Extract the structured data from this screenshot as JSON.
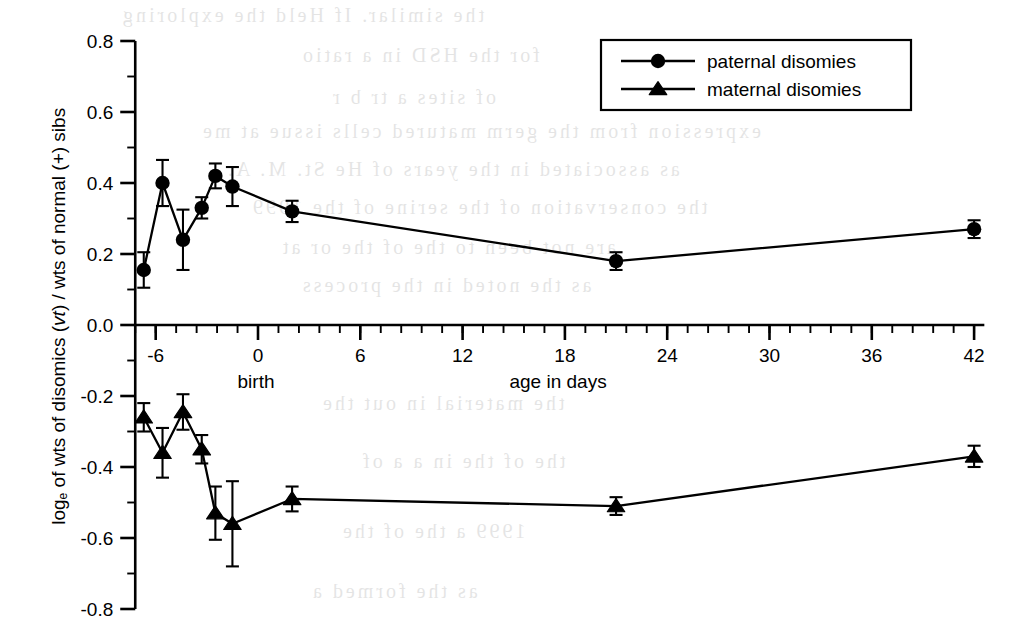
{
  "figure": {
    "background_color": "#ffffff",
    "ink_color": "#000000"
  },
  "y_axis": {
    "caption_prefix": "log",
    "caption_subscript": "e",
    "caption_mid": " of wts of disomics (",
    "caption_italic": "vt",
    "caption_suffix": ") / wts of normal (+) sibs",
    "tick_labels": [
      "0.8",
      "0.6",
      "0.4",
      "0.2",
      "0.0",
      "-0.2",
      "-0.4",
      "-0.6",
      "-0.8"
    ],
    "tick_values": [
      0.8,
      0.6,
      0.4,
      0.2,
      0.0,
      -0.2,
      -0.4,
      -0.6,
      -0.8
    ],
    "limits": [
      -0.8,
      0.8
    ],
    "minor_ticks_between": 1
  },
  "x_axis": {
    "title": "age in days",
    "birth_label": "birth",
    "tick_labels": [
      "-6",
      "0",
      "6",
      "12",
      "18",
      "24",
      "30",
      "36",
      "42"
    ],
    "tick_values": [
      -6,
      0,
      6,
      12,
      18,
      24,
      30,
      36,
      42
    ],
    "limits": [
      -7.2,
      42.6
    ],
    "minor_tick_step": 1.2
  },
  "legend": {
    "position": "top-right",
    "entries": [
      {
        "label": "paternal disomies",
        "marker": "circle"
      },
      {
        "label": "maternal disomies",
        "marker": "triangle"
      }
    ]
  },
  "chart_data": {
    "type": "line",
    "title": "",
    "xlabel": "age in days",
    "ylabel": "log_e of wts of disomics (vt) / wts of normal (+) sibs",
    "xlim": [
      -7.2,
      42.6
    ],
    "ylim": [
      -0.8,
      0.8
    ],
    "grid": false,
    "legend_position": "top-right",
    "error_bars": "symmetric (standard error)",
    "annotations": [
      {
        "text": "birth",
        "x": 0,
        "note": "label beneath x = 0 tick"
      }
    ],
    "series": [
      {
        "name": "paternal disomies",
        "marker": "circle",
        "x": [
          -6.7,
          -5.6,
          -4.4,
          -3.3,
          -2.5,
          -1.5,
          2.0,
          21.0,
          42.0
        ],
        "y": [
          0.155,
          0.4,
          0.24,
          0.33,
          0.42,
          0.39,
          0.32,
          0.18,
          0.27
        ],
        "yerr": [
          0.05,
          0.065,
          0.085,
          0.03,
          0.035,
          0.055,
          0.03,
          0.025,
          0.025
        ]
      },
      {
        "name": "maternal disomies",
        "marker": "triangle",
        "x": [
          -6.7,
          -5.6,
          -4.4,
          -3.3,
          -2.5,
          -1.5,
          2.0,
          21.0,
          42.0
        ],
        "y": [
          -0.26,
          -0.36,
          -0.245,
          -0.35,
          -0.53,
          -0.56,
          -0.49,
          -0.51,
          -0.37
        ],
        "yerr": [
          0.04,
          0.07,
          0.05,
          0.04,
          0.075,
          0.12,
          0.035,
          0.025,
          0.03
        ]
      }
    ]
  },
  "bleed_through_text": [
    {
      "text": "the similar. If Held the exploring",
      "x": 120,
      "y": 4
    },
    {
      "text": "for the HSD in a ratio",
      "x": 300,
      "y": 44
    },
    {
      "text": "of sites a tr b r",
      "x": 330,
      "y": 86
    },
    {
      "text": "expression from the germ matured cells issue at me",
      "x": 200,
      "y": 120
    },
    {
      "text": "as associated in the years of He St. M. A.",
      "x": 225,
      "y": 158
    },
    {
      "text": "the conservation of the serine of the 1999",
      "x": 250,
      "y": 196
    },
    {
      "text": "are not been to the of the or at",
      "x": 280,
      "y": 236
    },
    {
      "text": "as the noted in the process",
      "x": 300,
      "y": 274
    },
    {
      "text": "the material in out the",
      "x": 320,
      "y": 392
    },
    {
      "text": "the of the in a a of",
      "x": 360,
      "y": 450
    },
    {
      "text": "1999 a the of the",
      "x": 340,
      "y": 520
    },
    {
      "text": "as the formed a",
      "x": 310,
      "y": 580
    }
  ]
}
